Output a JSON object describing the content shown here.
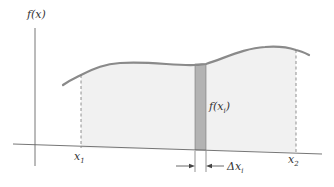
{
  "figure": {
    "type": "riemann-sum-area-diagram",
    "y_axis_label": "f(x)",
    "x_left_label": "x",
    "x_left_sub": "1",
    "x_right_label": "x",
    "x_right_sub": "2",
    "strip_label": "f(x",
    "strip_label_sub": "i",
    "strip_label_close": ")",
    "width_label": "Δx",
    "width_label_sub": "i",
    "colors": {
      "curve": "#8a8a8a",
      "area_fill": "#f1f1f1",
      "strip_fill": "#b3b3b3",
      "axis": "#666666",
      "text": "#333333"
    }
  }
}
